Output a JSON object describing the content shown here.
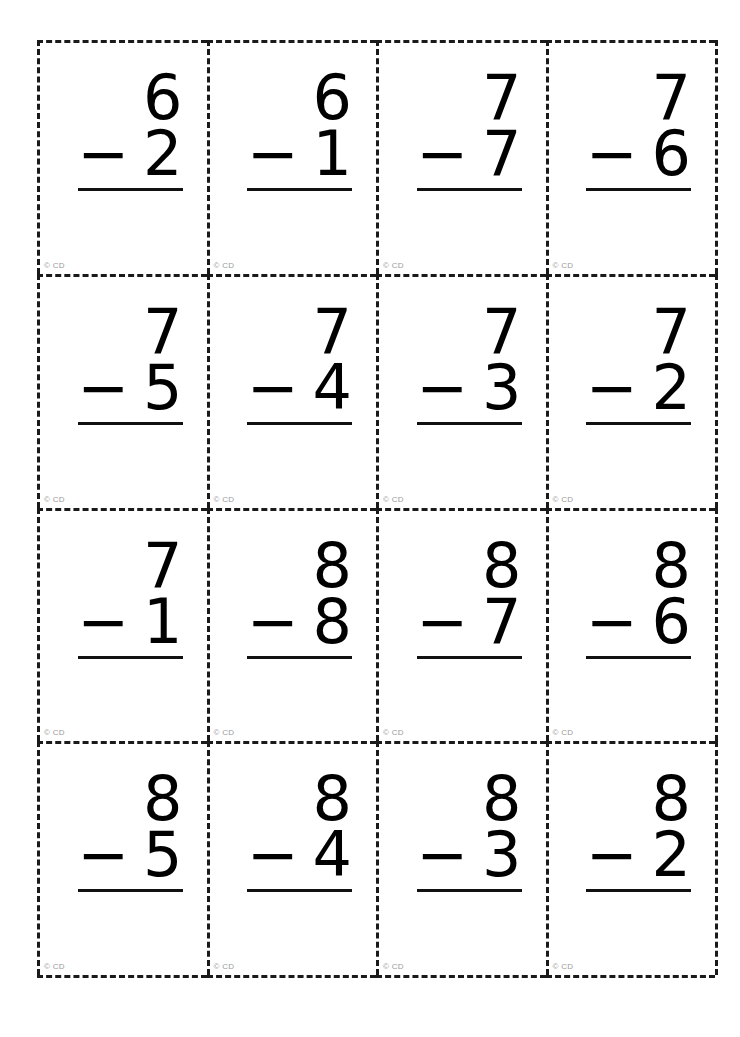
{
  "document": {
    "title": "Subtraction Flashcards",
    "operator": "−",
    "copyright_mark": "© CD",
    "grid": {
      "columns": 4,
      "rows": 4
    },
    "colors": {
      "ink": "#000000",
      "cut_line": "#1a1a1a",
      "rule": "#111111",
      "copyright_text": "#9b9b9b",
      "page_background": "#ffffff"
    }
  },
  "cards": [
    {
      "minuend": "6",
      "operator": "−",
      "subtrahend": "2",
      "copyright": "© CD"
    },
    {
      "minuend": "6",
      "operator": "−",
      "subtrahend": "1",
      "copyright": "© CD"
    },
    {
      "minuend": "7",
      "operator": "−",
      "subtrahend": "7",
      "copyright": "© CD"
    },
    {
      "minuend": "7",
      "operator": "−",
      "subtrahend": "6",
      "copyright": "© CD"
    },
    {
      "minuend": "7",
      "operator": "−",
      "subtrahend": "5",
      "copyright": "© CD"
    },
    {
      "minuend": "7",
      "operator": "−",
      "subtrahend": "4",
      "copyright": "© CD"
    },
    {
      "minuend": "7",
      "operator": "−",
      "subtrahend": "3",
      "copyright": "© CD"
    },
    {
      "minuend": "7",
      "operator": "−",
      "subtrahend": "2",
      "copyright": "© CD"
    },
    {
      "minuend": "7",
      "operator": "−",
      "subtrahend": "1",
      "copyright": "© CD"
    },
    {
      "minuend": "8",
      "operator": "−",
      "subtrahend": "8",
      "copyright": "© CD"
    },
    {
      "minuend": "8",
      "operator": "−",
      "subtrahend": "7",
      "copyright": "© CD"
    },
    {
      "minuend": "8",
      "operator": "−",
      "subtrahend": "6",
      "copyright": "© CD"
    },
    {
      "minuend": "8",
      "operator": "−",
      "subtrahend": "5",
      "copyright": "© CD"
    },
    {
      "minuend": "8",
      "operator": "−",
      "subtrahend": "4",
      "copyright": "© CD"
    },
    {
      "minuend": "8",
      "operator": "−",
      "subtrahend": "3",
      "copyright": "© CD"
    },
    {
      "minuend": "8",
      "operator": "−",
      "subtrahend": "2",
      "copyright": "© CD"
    }
  ]
}
